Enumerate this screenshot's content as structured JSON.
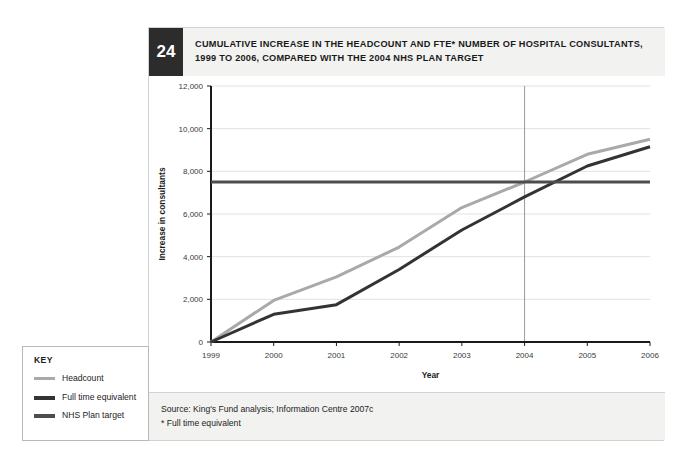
{
  "figure": {
    "number": "24",
    "title_line1": "CUMULATIVE INCREASE IN THE HEADCOUNT AND FTE* NUMBER OF HOSPITAL CONSULTANTS,",
    "title_line2": "1999 TO 2006, COMPARED WITH THE 2004 NHS PLAN TARGET"
  },
  "source": {
    "line1": "Source: King's Fund analysis; Information Centre 2007c",
    "line2": "* Full time equivalent"
  },
  "key": {
    "title": "KEY",
    "items": [
      {
        "label": "Headcount",
        "color": "#a9a9a9"
      },
      {
        "label": "Full time equivalent",
        "color": "#333333"
      },
      {
        "label": "NHS Plan target",
        "color": "#4d4d4d"
      }
    ]
  },
  "colors": {
    "headcount": "#a9a9a9",
    "fte": "#333333",
    "target": "#4d4d4d",
    "axis": "#1a1a1a",
    "grid": "#e2e2e2",
    "reference_line": "#9a9a9a",
    "panel_bg": "#f2f2f0",
    "badge_bg": "#2c2c2c"
  },
  "chart_data": {
    "type": "line",
    "title": "Cumulative increase in the headcount and FTE* number of hospital consultants, 1999 to 2006, compared with the 2004 NHS Plan target",
    "xlabel": "Year",
    "ylabel": "Increase in consultants",
    "x": [
      1999,
      2000,
      2001,
      2002,
      2003,
      2004,
      2005,
      2006
    ],
    "xtick_labels": [
      "1999",
      "2000",
      "2001",
      "2002",
      "2003",
      "2004",
      "2005",
      "2006"
    ],
    "ytick_labels": [
      "0",
      "2,000",
      "4,000",
      "6,000",
      "8,000",
      "10,000",
      "12,000"
    ],
    "yticks": [
      0,
      2000,
      4000,
      6000,
      8000,
      10000,
      12000
    ],
    "xlim": [
      1999,
      2006
    ],
    "ylim": [
      0,
      12000
    ],
    "grid": "horizontal",
    "legend_position": "outside-left",
    "series": [
      {
        "name": "Headcount",
        "color": "#a9a9a9",
        "values": [
          0,
          1950,
          3050,
          4450,
          6300,
          7500,
          8800,
          9500
        ]
      },
      {
        "name": "Full time equivalent",
        "color": "#333333",
        "values": [
          0,
          1300,
          1750,
          3400,
          5250,
          6800,
          8250,
          9150
        ]
      },
      {
        "name": "NHS Plan target",
        "color": "#4d4d4d",
        "constant_value": 7500,
        "values": [
          7500,
          7500,
          7500,
          7500,
          7500,
          7500,
          7500,
          7500
        ]
      }
    ],
    "annotations": [
      {
        "type": "vertical-reference-line",
        "x": 2004,
        "label": "2004 NHS Plan target year"
      }
    ]
  }
}
